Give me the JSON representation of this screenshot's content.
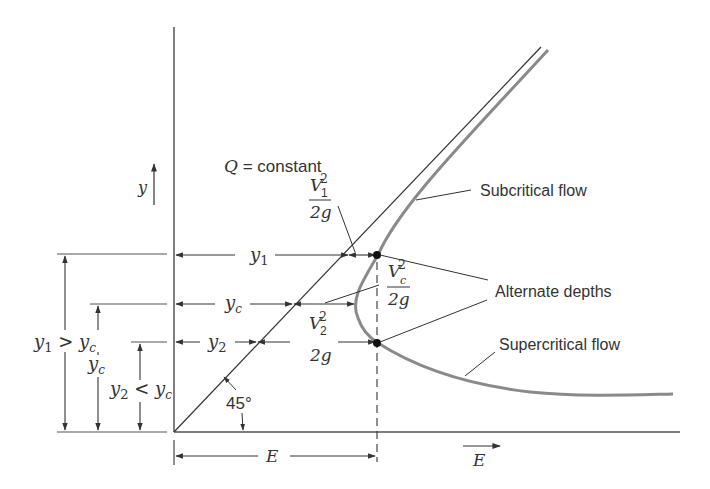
{
  "labels": {
    "q_constant_q": "Q",
    "q_constant_rest": " = constant",
    "y_axis": "y",
    "e_axis": "E",
    "subcritical": "Subcritical flow",
    "supercritical": "Supercritical flow",
    "alternate": "Alternate depths",
    "angle": "45°",
    "y1": "y",
    "y1_sub": "1",
    "yc": "y",
    "yc_sub": "c",
    "y2": "y",
    "y2_sub": "2",
    "E_dim": "E",
    "y1_gt_yc": {
      "a": "y",
      "a_sub": "1",
      "op": " > ",
      "b": "y",
      "b_sub": "c"
    },
    "y2_lt_yc": {
      "a": "y",
      "a_sub": "2",
      "op": " < ",
      "b": "y",
      "b_sub": "c"
    },
    "yc_left": {
      "a": "y",
      "a_sub": "c"
    },
    "v1_head": {
      "num": "V",
      "sub": "1",
      "sup": "2",
      "den": "2g"
    },
    "vc_head": {
      "num": "V",
      "sub": "c",
      "sup": "2",
      "den": "2g"
    },
    "v2_head": {
      "num": "V",
      "sub": "2",
      "sup": "2",
      "den": "2g"
    }
  },
  "colors": {
    "line": "#333333",
    "curve": "#8a8a8a",
    "background": "#ffffff"
  }
}
